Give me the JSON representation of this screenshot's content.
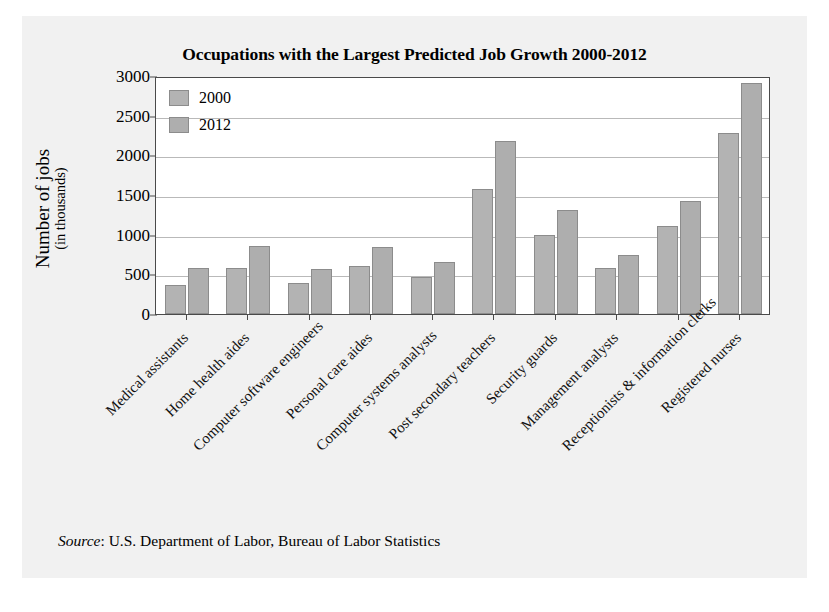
{
  "chart_data": {
    "type": "bar",
    "title": "Occupations with the Largest Predicted Job Growth 2000-2012",
    "xlabel": "",
    "ylabel": "Number of jobs",
    "ylabel_sub": "(in thousands)",
    "ylim": [
      0,
      3000
    ],
    "ytick_values": [
      0,
      500,
      1000,
      1500,
      2000,
      2500,
      3000
    ],
    "ytick_labels": [
      "0",
      "500",
      "1000",
      "1500",
      "2000",
      "2500",
      "3000"
    ],
    "grid": true,
    "legend_position": "top-left",
    "categories": [
      "Medical assistants",
      "Home health aides",
      "Computer software engineers",
      "Personal care aides",
      "Computer systems analysts",
      "Post secondary teachers",
      "Security guards",
      "Management analysts",
      "Receptionists & information clerks",
      "Registered nurses"
    ],
    "series": [
      {
        "name": "2000",
        "color": "#b3b3b3",
        "values": [
          365,
          580,
          395,
          610,
          470,
          1570,
          1000,
          580,
          1110,
          2280
        ]
      },
      {
        "name": "2012",
        "color": "#aeaeae",
        "values": [
          580,
          860,
          570,
          850,
          650,
          2180,
          1310,
          750,
          1420,
          2910
        ]
      }
    ],
    "source_label": "Source",
    "source_text": ": U.S. Department of Labor, Bureau of Labor Statistics"
  }
}
